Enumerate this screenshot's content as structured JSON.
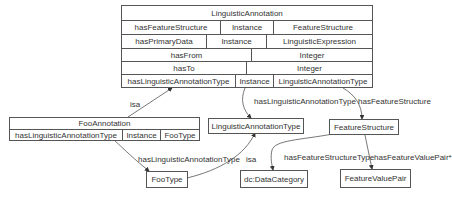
{
  "diagram": {
    "linguistic_annotation": {
      "title": "LinguisticAnnotation",
      "rows": [
        {
          "property": "hasFeatureStructure",
          "kind": "Instance",
          "range": "FeatureStructure"
        },
        {
          "property": "hasPrimaryData",
          "kind": "Instance",
          "range": "LinguisticExpression"
        },
        {
          "property": "hasFrom",
          "range": "Integer"
        },
        {
          "property": "hasTo",
          "range": "Integer"
        },
        {
          "property": "hasLinguisticAnnotationType",
          "kind": "Instance",
          "range": "LinguisticAnnotationType"
        }
      ]
    },
    "foo_annotation": {
      "title": "FooAnnotation",
      "rows": [
        {
          "property": "hasLinguisticAnnotationType",
          "kind": "Instance",
          "range": "FooType"
        }
      ]
    },
    "nodes": {
      "linguistic_annotation_type": "LinguisticAnnotationType",
      "feature_structure": "FeatureStructure",
      "foo_type": "FooType",
      "data_category": "dc:DataCategory",
      "feature_value_pair": "FeatureValuePair"
    },
    "edges": {
      "isa_foo_annotation": "isa",
      "has_linguistic_annotation_type": "hasLinguisticAnnotationType",
      "has_feature_structure": "hasFeatureStructure",
      "foo_has_linguistic_annotation_type": "hasLinguisticAnnotationType",
      "isa_foo_type": "isa",
      "has_feature_structure_type": "hasFeatureStructureType",
      "has_feature_value_pair": "hasFeatureValuePair*"
    }
  }
}
